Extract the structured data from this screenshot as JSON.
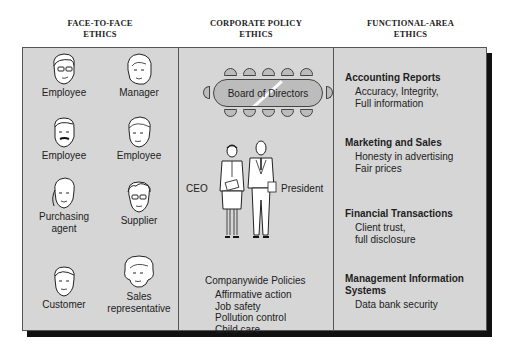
{
  "columns": [
    {
      "title_line1": "FACE-TO-FACE",
      "title_line2": "ETHICS"
    },
    {
      "title_line1": "CORPORATE POLICY",
      "title_line2": "ETHICS"
    },
    {
      "title_line1": "FUNCTIONAL-AREA",
      "title_line2": "ETHICS"
    }
  ],
  "face_to_face": {
    "people": [
      {
        "label": "Employee",
        "icon": "man-with-glasses-face-icon"
      },
      {
        "label": "Manager",
        "icon": "woman-face-icon"
      },
      {
        "label": "Employee",
        "icon": "man-with-mustache-face-icon"
      },
      {
        "label": "Employee",
        "icon": "young-man-face-icon"
      },
      {
        "label": "Purchasing agent",
        "label_line1": "Purchasing",
        "label_line2": "agent",
        "icon": "woman-ponytail-face-icon"
      },
      {
        "label": "Supplier",
        "icon": "man-glasses-bushy-hair-face-icon"
      },
      {
        "label": "Customer",
        "icon": "man-face-icon"
      },
      {
        "label": "Sales representative",
        "label_line1": "Sales",
        "label_line2": "representative",
        "icon": "woman-curly-hair-face-icon"
      }
    ]
  },
  "corporate_policy": {
    "board_label": "Board of Directors",
    "ceo_label": "CEO",
    "president_label": "President",
    "policies_title": "Companywide Policies",
    "policies": [
      "Affirmative action",
      "Job safety",
      "Pollution control",
      "Child care"
    ]
  },
  "functional_area": {
    "sections": [
      {
        "title": "Accounting Reports",
        "desc_lines": [
          "Accuracy, Integrity,",
          "Full information"
        ]
      },
      {
        "title": "Marketing and Sales",
        "desc_lines": [
          "Honesty in advertising",
          "Fair prices"
        ]
      },
      {
        "title": "Financial Transactions",
        "desc_lines": [
          "Client trust,",
          "full disclosure"
        ]
      },
      {
        "title_line1": "Management Information",
        "title_line2": "Systems",
        "title": "Management Information Systems",
        "desc_lines": [
          "Data bank security"
        ]
      }
    ]
  },
  "colors": {
    "panel_bg": "#d6d6d6",
    "border": "#555555",
    "shadow": "#111111",
    "table_fill": "#bcbcbc"
  }
}
